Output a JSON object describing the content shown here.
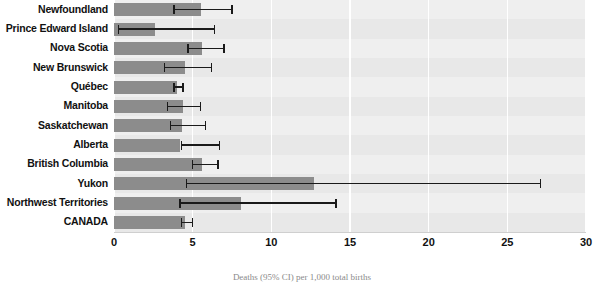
{
  "chart_data": {
    "type": "bar",
    "orientation": "horizontal",
    "title": "",
    "xlabel": "Deaths (95% CI) per 1,000 total births",
    "ylabel": "",
    "xlim": [
      0,
      30
    ],
    "xticks": [
      0,
      5,
      10,
      15,
      20,
      25,
      30
    ],
    "xtick_labels": [
      "0",
      "5",
      "10",
      "15",
      "20",
      "25",
      "30"
    ],
    "grid": true,
    "grid_axis": "x",
    "legend": false,
    "categories": [
      "Newfoundland",
      "Prince Edward Island",
      "Nova Scotia",
      "New Brunswick",
      "Québec",
      "Manitoba",
      "Saskatchewan",
      "Alberta",
      "British Columbia",
      "Yukon",
      "Northwest Territories",
      "CANADA"
    ],
    "values": [
      5.5,
      2.6,
      5.6,
      4.5,
      4.0,
      4.4,
      4.3,
      4.2,
      5.6,
      12.7,
      8.1,
      4.5
    ],
    "ci_low": [
      3.8,
      0.3,
      4.7,
      3.2,
      3.8,
      3.4,
      3.6,
      4.3,
      5.0,
      4.6,
      4.2,
      4.3
    ],
    "ci_high": [
      7.5,
      6.4,
      7.0,
      6.2,
      4.4,
      5.5,
      5.8,
      6.7,
      6.6,
      27.1,
      14.1,
      5.0
    ],
    "bar_color": "#8c8c8c",
    "error_color": "#1a1a1a",
    "plot_background": "#e8e8e8",
    "band_color": "#efefef",
    "gridline_color": "#ffffff"
  },
  "caption": "Deaths (95% CI) per 1,000 total births"
}
